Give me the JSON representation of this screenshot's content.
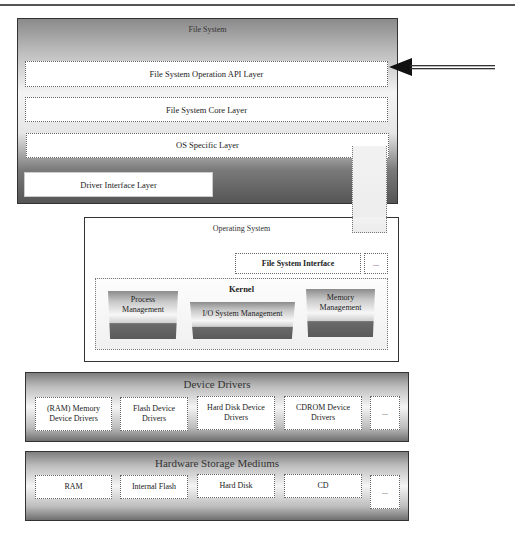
{
  "file_system": {
    "title": "File System",
    "layers": [
      {
        "label": "File System Operation API Layer"
      },
      {
        "label": "File System Core Layer"
      },
      {
        "label": "OS Specific Layer"
      },
      {
        "label": "Driver Interface Layer"
      }
    ],
    "arrow": "entry-arrow"
  },
  "operating_system": {
    "title": "Operating System",
    "file_system_interface": "File System Interface",
    "more": "...",
    "kernel": {
      "title": "Kernel",
      "modules": [
        {
          "label": "Process Management"
        },
        {
          "label": "I/O System Management"
        },
        {
          "label": "Memory Management"
        }
      ]
    }
  },
  "device_drivers": {
    "title": "Device Drivers",
    "items": [
      {
        "label": "(RAM) Memory Device Drivers"
      },
      {
        "label": "Flash Device Drivers"
      },
      {
        "label": "Hard Disk Device Drivers"
      },
      {
        "label": "CDROM Device Drivers"
      },
      {
        "label": "..."
      }
    ]
  },
  "hardware": {
    "title": "Hardware Storage Mediums",
    "items": [
      {
        "label": "RAM"
      },
      {
        "label": "Internal Flash"
      },
      {
        "label": "Hard Disk"
      },
      {
        "label": "CD"
      },
      {
        "label": "..."
      }
    ]
  }
}
